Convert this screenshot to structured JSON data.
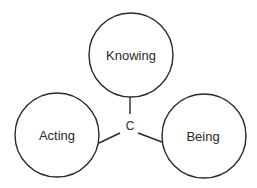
{
  "diagram": {
    "type": "triad",
    "center": {
      "label": "C",
      "x": 130,
      "y": 126
    },
    "nodes": [
      {
        "id": "knowing",
        "label": "Knowing",
        "cx": 131,
        "cy": 55,
        "r": 42
      },
      {
        "id": "acting",
        "label": "Acting",
        "cx": 57,
        "cy": 135,
        "r": 42
      },
      {
        "id": "being",
        "label": "Being",
        "cx": 204,
        "cy": 136,
        "r": 42
      }
    ],
    "edges": [
      {
        "from": "C",
        "to": "knowing"
      },
      {
        "from": "C",
        "to": "acting"
      },
      {
        "from": "C",
        "to": "being"
      }
    ],
    "colors": {
      "stroke": "#2a2a2a",
      "background": "#ffffff"
    }
  }
}
